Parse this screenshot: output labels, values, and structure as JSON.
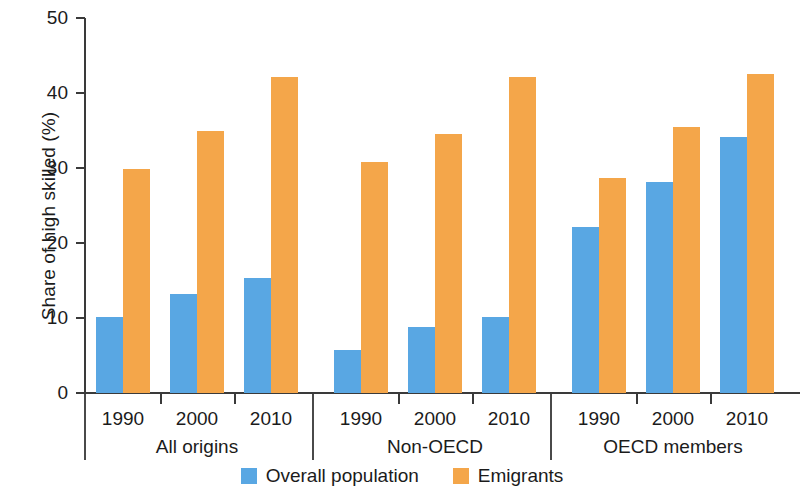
{
  "chart_data": {
    "type": "bar",
    "title": "",
    "subtitle": "",
    "xlabel": "",
    "ylabel": "Share of high skilled (%)",
    "ylim": [
      0,
      50
    ],
    "yticks": [
      0,
      10,
      20,
      30,
      40,
      50
    ],
    "ytick_labels": [
      "0",
      "10",
      "20",
      "30",
      "40",
      "50"
    ],
    "grid": false,
    "legend_position": "bottom-center",
    "categories": [
      "1990",
      "2000",
      "2010",
      "1990",
      "2000",
      "2010",
      "1990",
      "2000",
      "2010"
    ],
    "groups": [
      {
        "label": "All origins",
        "categories": [
          "1990",
          "2000",
          "2010"
        ],
        "series": [
          {
            "name": "Overall population",
            "values": [
              10.1,
              13.2,
              15.3
            ]
          },
          {
            "name": "Emigrants",
            "values": [
              29.9,
              35.0,
              42.2
            ]
          }
        ]
      },
      {
        "label": "Non-OECD",
        "categories": [
          "1990",
          "2000",
          "2010"
        ],
        "series": [
          {
            "name": "Overall population",
            "values": [
              5.8,
              8.8,
              10.2
            ]
          },
          {
            "name": "Emigrants",
            "values": [
              30.8,
              34.5,
              42.1
            ]
          }
        ]
      },
      {
        "label": "OECD members",
        "categories": [
          "1990",
          "2000",
          "2010"
        ],
        "series": [
          {
            "name": "Overall population",
            "values": [
              22.2,
              28.1,
              34.2
            ]
          },
          {
            "name": "Emigrants",
            "values": [
              28.7,
              35.5,
              42.5
            ]
          }
        ]
      }
    ],
    "series": [
      {
        "name": "Overall population",
        "color": "#59a7e3",
        "values": [
          10.1,
          13.2,
          15.3,
          5.8,
          8.8,
          10.2,
          22.2,
          28.1,
          34.2
        ]
      },
      {
        "name": "Emigrants",
        "color": "#f4a64a",
        "values": [
          29.9,
          35.0,
          42.2,
          30.8,
          34.5,
          42.1,
          28.7,
          35.5,
          42.5
        ]
      }
    ]
  },
  "legend": {
    "items": [
      {
        "label": "Overall population",
        "color": "#59a7e3"
      },
      {
        "label": "Emigrants",
        "color": "#f4a64a"
      }
    ]
  },
  "colors": {
    "overall_population": "#59a7e3",
    "emigrants": "#f4a64a",
    "axis": "#3a3a3a",
    "text": "#1b1b1b",
    "background": "#ffffff"
  }
}
